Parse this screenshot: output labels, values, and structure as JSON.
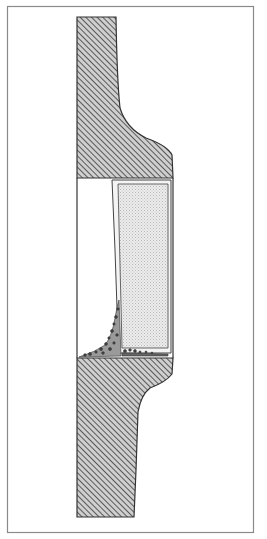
{
  "diagram": {
    "type": "cross-section illustration",
    "colors": {
      "frame": "#8a8a8a",
      "outline": "#333333",
      "hatch": "#555555",
      "hatch_bg": "#d8d8d8",
      "fill_panel": "#e6e6e6",
      "panel_dots": "#bdbdbd",
      "debris": "#444444",
      "background": "#ffffff"
    },
    "parts": [
      {
        "name": "upper-hatched-section",
        "label": ""
      },
      {
        "name": "lower-hatched-section",
        "label": ""
      },
      {
        "name": "shaded-panel",
        "label": ""
      },
      {
        "name": "debris-accumulation",
        "label": ""
      }
    ]
  }
}
